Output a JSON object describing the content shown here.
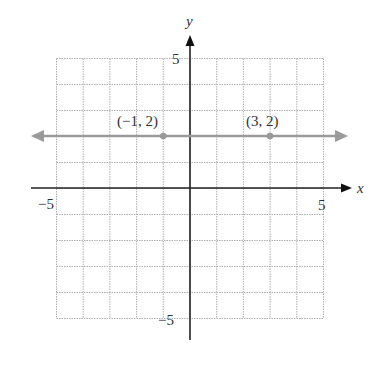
{
  "chart_data": {
    "type": "line",
    "title": "",
    "xlabel": "x",
    "ylabel": "y",
    "xlim": [
      -5,
      5
    ],
    "ylim": [
      -5,
      5
    ],
    "grid": true,
    "x_ticks_labeled": [
      "-5",
      "5"
    ],
    "y_ticks_labeled": [
      "5",
      "-5"
    ],
    "series": [
      {
        "name": "y = 2",
        "equation": "y = 2",
        "x": [
          -5,
          5
        ],
        "y": [
          2,
          2
        ],
        "extends_both_directions": true
      }
    ],
    "points": [
      {
        "label": "(−1, 2)",
        "x": -1,
        "y": 2
      },
      {
        "label": "(3, 2)",
        "x": 3,
        "y": 2
      }
    ]
  },
  "labels": {
    "x_axis": "x",
    "y_axis": "y",
    "x_min": "−5",
    "x_max": "5",
    "y_max": "5",
    "y_min": "−5",
    "point_a": "(−1, 2)",
    "point_b": "(3, 2)"
  },
  "colors": {
    "grid": "#aaaaaa",
    "axis": "#222222",
    "line": "#999999",
    "point": "#999999"
  }
}
